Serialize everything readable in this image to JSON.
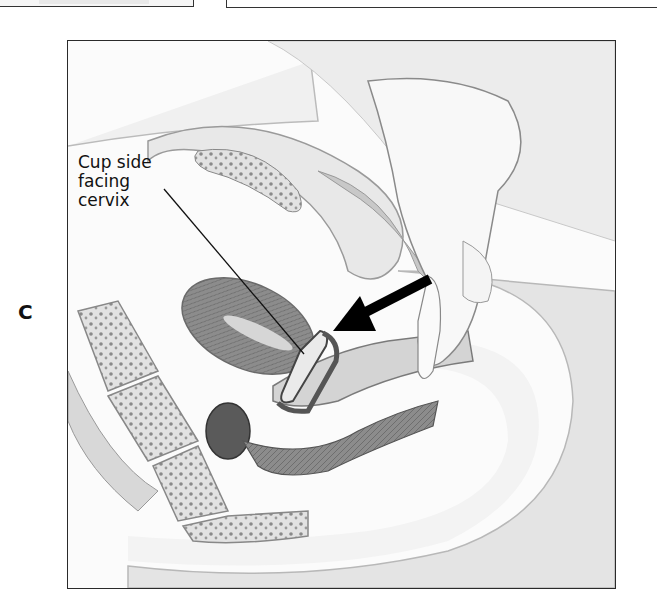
{
  "figure": {
    "panel_label": "C",
    "callout": {
      "lines": [
        "Cup side",
        "facing",
        "cervix"
      ],
      "points_to": "diaphragm cup"
    },
    "arrow": {
      "direction": "left-down",
      "meaning": "insertion direction",
      "color": "#000000"
    },
    "style": {
      "ink": "#111111",
      "tissue_light": "#e6e6e6",
      "tissue_mid": "#bdbdbd",
      "tissue_dark": "#7a7a7a",
      "frame_border": "#2a2a2a"
    }
  }
}
